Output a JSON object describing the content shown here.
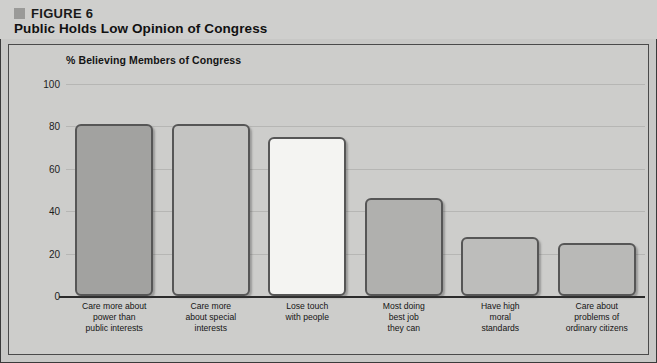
{
  "figure": {
    "marker": "square-bullet",
    "number_label": "FIGURE 6",
    "title": "Public Holds Low Opinion of Congress"
  },
  "chart_data": {
    "type": "bar",
    "title": "Public Holds Low Opinion of Congress",
    "subtitle": "% Believing Members of Congress",
    "xlabel": "",
    "ylabel": "",
    "ylim": [
      0,
      100
    ],
    "yticks": [
      0,
      20,
      40,
      60,
      80,
      100
    ],
    "grid": true,
    "legend": "none",
    "categories": [
      "Care more about power than public interests",
      "Care more about special interests",
      "Lose touch with people",
      "Most doing best job they can",
      "Have high moral standards",
      "Care about problems of ordinary citizens"
    ],
    "category_lines": [
      [
        "Care more about",
        "power than",
        "public interests"
      ],
      [
        "Care more",
        "about special",
        "interests"
      ],
      [
        "Lose touch",
        "with people"
      ],
      [
        "Most doing",
        "best job",
        "they can"
      ],
      [
        "Have high",
        "moral",
        "standards"
      ],
      [
        "Care about",
        "problems of",
        "ordinary citizens"
      ]
    ],
    "values": [
      81,
      81,
      75,
      46,
      28,
      25
    ],
    "bar_colors": [
      "#a2a2a0",
      "#c4c4c2",
      "#f4f4f2",
      "#b0b0ae",
      "#bdbdbb",
      "#b9b9b7"
    ],
    "bar_border_color": "#565656"
  },
  "colors": {
    "page_background": "#c8c8c6",
    "header_background": "#cfcfcd",
    "panel_background": "#cdcdcb",
    "frame": "#3a3a3a",
    "gridline": "#b6b6b4",
    "axis": "#2b2b2b",
    "text": "#141414",
    "marker": "#9a9a98"
  }
}
